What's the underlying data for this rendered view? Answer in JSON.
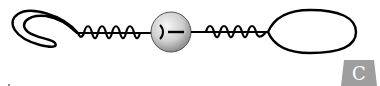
{
  "diagram": {
    "components": [
      {
        "name": "hook-loop",
        "position": "left"
      },
      {
        "name": "spring-linker-left",
        "position": "center-left"
      },
      {
        "name": "sphere",
        "position": "center"
      },
      {
        "name": "spring-linker-right",
        "position": "center-right"
      },
      {
        "name": "oval-loop",
        "position": "right"
      }
    ],
    "colors": {
      "stroke": "#000000",
      "sphere_light": "#f4f4f4",
      "sphere_dark": "#9a9a9a",
      "badge": "#9e9e9e"
    }
  },
  "badge": {
    "label": "C"
  }
}
